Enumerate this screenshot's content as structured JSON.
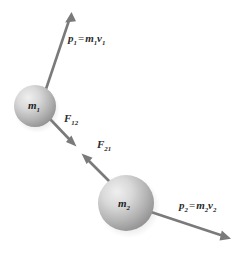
{
  "figure": {
    "background_color": "#ffffff",
    "stroke_color": "#7a7a7a",
    "label_color": "#2b2b2b"
  },
  "spheres": [
    {
      "id": "sphere-m1",
      "label_base": "m",
      "label_sub": "1",
      "cx": 35,
      "cy": 106,
      "r": 21,
      "highlight_color": "#ececec",
      "mid_color": "#bdbdbd",
      "edge_color": "#8a8a8a"
    },
    {
      "id": "sphere-m2",
      "label_base": "m",
      "label_sub": "2",
      "cx": 126,
      "cy": 203,
      "r": 28,
      "highlight_color": "#ececec",
      "mid_color": "#bdbdbd",
      "edge_color": "#8a8a8a"
    }
  ],
  "vectors": [
    {
      "id": "vector-p1",
      "name": "p1",
      "base": "p",
      "sub": "1",
      "equals": "=",
      "rhs_m": "m",
      "rhs_m_sub": "1",
      "rhs_v": "v",
      "rhs_v_sub": "1",
      "from": [
        45,
        90
      ],
      "to": [
        71,
        13
      ],
      "color": "#7a7a7a"
    },
    {
      "id": "vector-f12",
      "name": "F12",
      "base": "F",
      "sub": "12",
      "from": [
        50,
        119
      ],
      "to": [
        76,
        146
      ],
      "color": "#7a7a7a"
    },
    {
      "id": "vector-f21",
      "name": "F21",
      "base": "F",
      "sub": "21",
      "from": [
        110,
        182
      ],
      "to": [
        82,
        154
      ],
      "color": "#7a7a7a"
    },
    {
      "id": "vector-p2",
      "name": "p2",
      "base": "p",
      "sub": "2",
      "equals": "=",
      "rhs_m": "m",
      "rhs_m_sub": "2",
      "rhs_v": "v",
      "rhs_v_sub": "2",
      "from": [
        151,
        212
      ],
      "to": [
        231,
        239
      ],
      "color": "#7a7a7a"
    }
  ]
}
